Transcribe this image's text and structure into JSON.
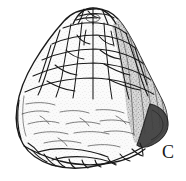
{
  "figure": {
    "kind": "scientific-specimen-illustration",
    "label": "C",
    "background_color": "#ffffff",
    "ink_color": "#1a1a1a",
    "shading_color": "#4a4a4a",
    "light_tone_color": "#e8e8e8",
    "regions": [
      {
        "name": "apex-crown",
        "description": "small clustered plates at the top of the dome"
      },
      {
        "name": "upper-plated-zone",
        "description": "tessellated polygonal plates covering the upper dome"
      },
      {
        "name": "lower-eroded-zone",
        "description": "smooth lightly hatched worn lower body"
      },
      {
        "name": "right-shadow-flank",
        "description": "dark shaded right flank with a rounded lobe"
      },
      {
        "name": "basal-margin",
        "description": "irregular broken bottom edge of the specimen"
      }
    ]
  }
}
